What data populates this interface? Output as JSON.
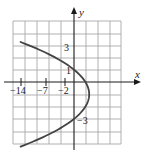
{
  "diagram": {
    "type": "coordinate-graph",
    "axes": {
      "x_label": "x",
      "y_label": "y"
    },
    "x_ticks": [
      {
        "value": -14,
        "label": "−14"
      },
      {
        "value": -7,
        "label": "−7"
      },
      {
        "value": -2,
        "label": "−2"
      }
    ],
    "y_ticks": [
      {
        "value": 3,
        "label": "3"
      },
      {
        "value": 1,
        "label": "1"
      },
      {
        "value": -3,
        "label": "−3"
      }
    ],
    "curve": {
      "kind": "parabola",
      "equation": "x = -y^2 - 2y + 3",
      "vertex": [
        4,
        -1
      ],
      "y_intercepts": [
        1,
        -3
      ],
      "color": "#444444"
    },
    "colors": {
      "grid": "#a8a8a8",
      "axis": "#1a1a1a",
      "background": "#ffffff"
    }
  }
}
